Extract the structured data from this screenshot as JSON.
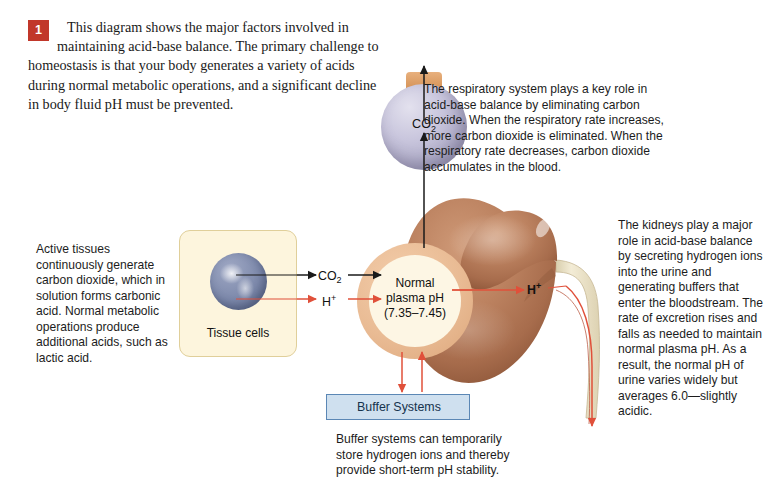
{
  "figure": {
    "badge_number": "1",
    "intro_text": "This diagram shows the major factors involved in maintaining acid-base balance. The primary challenge to homeostasis is that your body generates a variety of acids during normal metabolic operations, and a significant decline in body fluid pH must be prevented."
  },
  "notes": {
    "respiratory": "The respiratory system plays a key role in acid-base balance by eliminating carbon dioxide. When the respiratory rate increases, more carbon dioxide is eliminated. When the respiratory rate decreases, carbon dioxide accumulates in the blood.",
    "kidney": "The kidneys play a major role in acid-base balance by secreting hydrogen ions into the urine and generating buffers that enter the bloodstream. The rate of excretion rises and falls as needed to maintain normal plasma pH. As a result, the normal pH of urine varies widely but averages 6.0—slightly acidic.",
    "tissue": "Active tissues continuously generate carbon dioxide, which in solution forms carbonic acid. Normal metabolic operations produce additional acids, such as lactic acid.",
    "buffer": "Buffer systems can temporarily store hydrogen ions and thereby provide short-term pH stability."
  },
  "structures": {
    "co2_sphere_label": "CO",
    "co2_sphere_subscript": "2",
    "plasma_label": "Normal\nplasma pH\n(7.35–7.45)",
    "plasma_ph_range": "(7.35–7.45)",
    "plasma_ph_low": "7.35",
    "plasma_ph_high": "7.45",
    "tissue_label": "Tissue cells",
    "buffer_label": "Buffer Systems"
  },
  "arrow_labels": {
    "co2_transport": "CO",
    "co2_transport_subscript": "2",
    "hydrogen_transport": "H",
    "hydrogen_transport_superscript": "+",
    "hydrogen_kidney": "H",
    "hydrogen_kidney_superscript": "+"
  },
  "colors": {
    "badge_red": "#c1372a",
    "arrow_red": "#e0503a",
    "arrow_black": "#1a1a1a",
    "plasma_ring": "#e9bb94",
    "plasma_core": "#fdf6e4",
    "tissue_box_fill": "#fdf5dd",
    "tissue_box_border": "#e0cf9a",
    "buffer_fill": "#cfe0ef",
    "buffer_border": "#5b87b5",
    "co2_sphere": "#c9c6dd",
    "kidney_brown": "#b3795a",
    "ureter_cream": "#ece2c8",
    "background": "#ffffff"
  }
}
